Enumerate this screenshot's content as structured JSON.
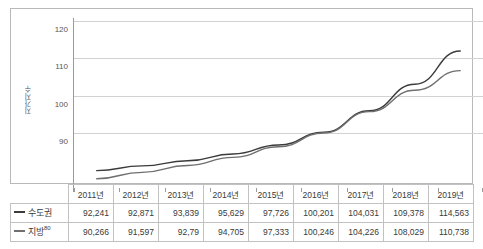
{
  "chart_data": {
    "type": "line",
    "title": "",
    "xlabel": "",
    "ylabel": "지가지수",
    "ylim": [
      80,
      120
    ],
    "yticks": [
      90,
      100,
      110,
      120
    ],
    "ytick_labels": [
      "90",
      "100",
      "110",
      "120"
    ],
    "grid": true,
    "legend_position": "table-left",
    "categories": [
      "2011년",
      "2012년",
      "2013년",
      "2014년",
      "2015년",
      "2016년",
      "2017년",
      "2018년",
      "2019년"
    ],
    "series": [
      {
        "name": "수도권",
        "color": "#3b3b3b",
        "values": [
          85.0,
          86.1,
          87.3,
          88.9,
          91.0,
          94.0,
          99.0,
          105.2,
          113.0
        ],
        "table_values": [
          "92,241",
          "92,871",
          "93,839",
          "95,629",
          "97,726",
          "100,201",
          "104,031",
          "109,378",
          "114,563"
        ]
      },
      {
        "name": "지방",
        "name_superscript": "80",
        "color": "#6f6f6f",
        "values": [
          83.1,
          84.6,
          86.2,
          88.1,
          90.6,
          93.8,
          98.8,
          103.8,
          108.4
        ],
        "table_values": [
          "90,266",
          "91,597",
          "92,79",
          "94,705",
          "97,333",
          "100,246",
          "104,226",
          "108,029",
          "110,738"
        ]
      }
    ]
  },
  "table": {
    "corner_label": "",
    "header": [
      "2011년",
      "2012년",
      "2013년",
      "2014년",
      "2015년",
      "2016년",
      "2017년",
      "2018년",
      "2019년"
    ],
    "rows": [
      {
        "legend": "수도권",
        "legend_superscript": "",
        "cells": [
          "92,241",
          "92,871",
          "93,839",
          "95,629",
          "97,726",
          "100,201",
          "104,031",
          "109,378",
          "114,563"
        ]
      },
      {
        "legend": "지방",
        "legend_superscript": "80",
        "cells": [
          "90,266",
          "91,597",
          "92,79",
          "94,705",
          "97,333",
          "100,246",
          "104,226",
          "108,029",
          "110,738"
        ]
      }
    ]
  },
  "axis": {
    "y_title": "지가지수",
    "y_ticks": [
      "120",
      "110",
      "100",
      "90"
    ]
  }
}
